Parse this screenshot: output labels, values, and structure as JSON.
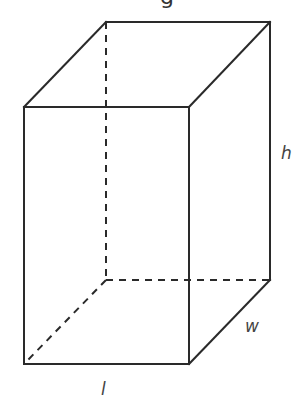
{
  "diagram": {
    "type": "rectangular-prism",
    "title_fragment": "g",
    "colors": {
      "edge": "#2a2a2a",
      "label": "#444444",
      "background": "#ffffff"
    },
    "vertices": {
      "front_top_left": [
        24,
        107
      ],
      "front_top_right": [
        189,
        107
      ],
      "front_bottom_left": [
        24,
        364
      ],
      "front_bottom_right": [
        189,
        364
      ],
      "back_top_left": [
        106,
        22
      ],
      "back_top_right": [
        270,
        22
      ],
      "back_bottom_left": [
        106,
        280
      ],
      "back_bottom_right": [
        270,
        280
      ]
    },
    "labels": {
      "height": "h",
      "width": "w",
      "length": "l"
    },
    "hidden_edges": [
      "back_top_left-back_bottom_left",
      "back_bottom_left-back_bottom_right",
      "back_bottom_left-front_bottom_left"
    ]
  }
}
